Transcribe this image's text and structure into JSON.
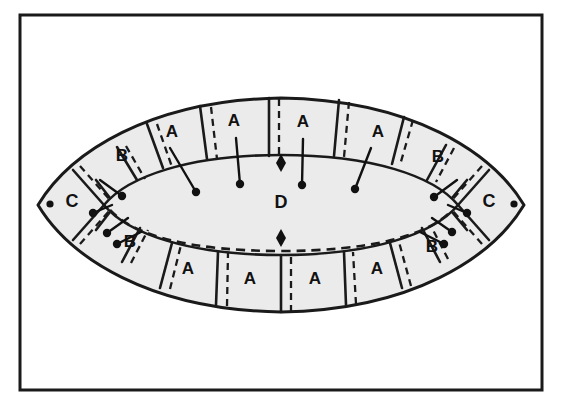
{
  "figure": {
    "frame": {
      "name": "outer-border",
      "x": 20,
      "y": 15,
      "width": 522,
      "height": 375,
      "stroke_color": "#1a1a1a",
      "stroke_width": 3,
      "fill_color": "#ffffff"
    },
    "colors": {
      "ink": "#111111",
      "outline": "#1a1a1a",
      "fill": "#ebebeb",
      "paper": "#ffffff"
    },
    "shapes": {
      "outer_lens_name": "outer-lens-boundary",
      "inner_lens_name": "inner-lens-boundary",
      "inner_dashed_name": "inner-lens-dashed-line"
    },
    "segments": [
      {
        "id": "top-b-left",
        "label": "B",
        "x": 122,
        "y": 157,
        "row": "top",
        "side": "left",
        "has_pin": true
      },
      {
        "id": "top-a-1",
        "label": "A",
        "x": 172,
        "y": 133,
        "row": "top",
        "side": "left",
        "has_pin": true
      },
      {
        "id": "top-a-2",
        "label": "A",
        "x": 234,
        "y": 122,
        "row": "top",
        "side": "left",
        "has_pin": true
      },
      {
        "id": "top-a-3",
        "label": "A",
        "x": 303,
        "y": 123,
        "row": "top",
        "side": "right",
        "has_pin": true
      },
      {
        "id": "top-a-4",
        "label": "A",
        "x": 378,
        "y": 133,
        "row": "top",
        "side": "right",
        "has_pin": true
      },
      {
        "id": "top-b-right",
        "label": "B",
        "x": 438,
        "y": 158,
        "row": "top",
        "side": "right",
        "has_pin": true
      },
      {
        "id": "tip-c-left",
        "label": "C",
        "x": 72,
        "y": 202,
        "row": "middle",
        "side": "left",
        "has_pin": true
      },
      {
        "id": "center-d",
        "label": "D",
        "x": 281,
        "y": 203,
        "row": "middle",
        "side": "center",
        "has_pin": false
      },
      {
        "id": "tip-c-right",
        "label": "C",
        "x": 489,
        "y": 202,
        "row": "middle",
        "side": "right",
        "has_pin": true
      },
      {
        "id": "bot-b-left",
        "label": "B",
        "x": 130,
        "y": 243,
        "row": "bottom",
        "side": "left",
        "has_pin": true
      },
      {
        "id": "bot-a-1",
        "label": "A",
        "x": 188,
        "y": 270,
        "row": "bottom",
        "side": "left",
        "has_pin": false
      },
      {
        "id": "bot-a-2",
        "label": "A",
        "x": 250,
        "y": 280,
        "row": "bottom",
        "side": "left",
        "has_pin": false
      },
      {
        "id": "bot-a-3",
        "label": "A",
        "x": 315,
        "y": 280,
        "row": "bottom",
        "side": "right",
        "has_pin": false
      },
      {
        "id": "bot-a-4",
        "label": "A",
        "x": 377,
        "y": 270,
        "row": "bottom",
        "side": "right",
        "has_pin": false
      },
      {
        "id": "bot-b-right",
        "label": "B",
        "x": 432,
        "y": 248,
        "row": "bottom",
        "side": "right",
        "has_pin": true
      }
    ],
    "markers": {
      "diamond_top": {
        "name": "diamond-marker-top",
        "x": 281,
        "y": 162
      },
      "diamond_bottom": {
        "name": "diamond-marker-bottom",
        "x": 281,
        "y": 237
      },
      "tip_dot_left": {
        "name": "tip-dot-left",
        "x": 48,
        "y": 204
      },
      "tip_dot_right": {
        "name": "tip-dot-right",
        "x": 516,
        "y": 204
      }
    },
    "pins": [
      {
        "id": "pin-top-1",
        "x1": 170,
        "y1": 148,
        "x2": 196,
        "y2": 192
      },
      {
        "id": "pin-top-2",
        "x1": 236,
        "y1": 138,
        "x2": 240,
        "y2": 184
      },
      {
        "id": "pin-top-3",
        "x1": 303,
        "y1": 139,
        "x2": 302,
        "y2": 185
      },
      {
        "id": "pin-top-4",
        "x1": 371,
        "y1": 148,
        "x2": 355,
        "y2": 189
      },
      {
        "id": "pin-b-top-left",
        "x1": 100,
        "y1": 180,
        "x2": 122,
        "y2": 196
      },
      {
        "id": "pin-b-top-right",
        "x1": 457,
        "y1": 180,
        "x2": 434,
        "y2": 197
      },
      {
        "id": "pin-b-bot-left-a",
        "x1": 128,
        "y1": 218,
        "x2": 107,
        "y2": 233
      },
      {
        "id": "pin-b-bot-left-b",
        "x1": 141,
        "y1": 232,
        "x2": 117,
        "y2": 244
      },
      {
        "id": "pin-b-bot-right-a",
        "x1": 432,
        "y1": 218,
        "x2": 452,
        "y2": 232
      },
      {
        "id": "pin-b-bot-right-b",
        "x1": 420,
        "y1": 232,
        "x2": 444,
        "y2": 244
      },
      {
        "id": "pin-c-left",
        "x1": 112,
        "y1": 205,
        "x2": 93,
        "y2": 213
      },
      {
        "id": "pin-c-right",
        "x1": 448,
        "y1": 205,
        "x2": 467,
        "y2": 213
      }
    ]
  }
}
